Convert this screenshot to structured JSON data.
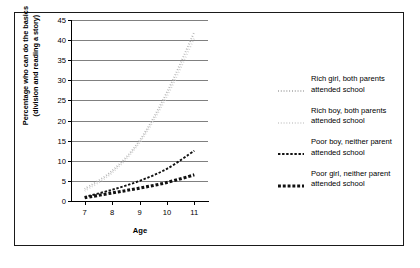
{
  "chart_data": {
    "type": "line",
    "title": "",
    "xlabel": "Age",
    "ylabel_line1": "Percentage who can do the basics",
    "ylabel_line2": "(division and reading a story)",
    "x": [
      7,
      8,
      9,
      10,
      11
    ],
    "xlim": [
      6.5,
      11.5
    ],
    "ylim": [
      0,
      45
    ],
    "yticks": [
      0,
      5,
      10,
      15,
      20,
      25,
      30,
      35,
      40,
      45
    ],
    "xticks": [
      7,
      8,
      9,
      10,
      11
    ],
    "grid": "horizontal",
    "legend_position": "right",
    "series": [
      {
        "name": "Rich girl, both parents attended school",
        "label_line1": "Rich girl, both parents",
        "label_line2": "attended school",
        "color": "#b3b3b3",
        "style": "dotted-fine",
        "values": [
          3.0,
          7.5,
          15.0,
          27.0,
          42.0
        ]
      },
      {
        "name": "Rich boy, both parents attended school",
        "label_line1": "Rich boy, both parents",
        "label_line2": "attended school",
        "color": "#d4d4d4",
        "style": "dotted-fine-light",
        "values": [
          2.5,
          7.0,
          14.5,
          26.0,
          40.5
        ]
      },
      {
        "name": "Poor boy, neither parent attended school",
        "label_line1": "Poor boy, neither parent",
        "label_line2": "attended school",
        "color": "#111111",
        "style": "dashed-thin",
        "values": [
          1.0,
          2.8,
          5.0,
          8.0,
          12.5
        ]
      },
      {
        "name": "Poor girl, neither parent attended school",
        "label_line1": "Poor girl, neither parent",
        "label_line2": "attended school",
        "color": "#111111",
        "style": "dashed-thick",
        "values": [
          0.8,
          2.0,
          3.2,
          4.6,
          6.5
        ]
      }
    ]
  },
  "axes": {
    "y_tick_labels": [
      "0",
      "5",
      "10",
      "15",
      "20",
      "25",
      "30",
      "35",
      "40",
      "45"
    ],
    "x_tick_labels": [
      "7",
      "8",
      "9",
      "10",
      "11"
    ],
    "x_title": "Age",
    "y_title_line1": "Percentage who can do the basics",
    "y_title_line2": "(division and reading a story)"
  },
  "legend": {
    "entries": [
      {
        "line1": "Rich girl, both parents",
        "line2": "attended school"
      },
      {
        "line1": "Rich boy, both parents",
        "line2": "attended school"
      },
      {
        "line1": "Poor boy, neither parent",
        "line2": "attended school"
      },
      {
        "line1": "Poor girl, neither parent",
        "line2": "attended school"
      }
    ]
  },
  "colors": {
    "grid": "#808080",
    "axis": "#000000",
    "frame": "#1a1a1a",
    "rich_girl": "#b3b3b3",
    "rich_boy": "#d4d4d4",
    "poor_boy": "#111111",
    "poor_girl": "#111111"
  }
}
